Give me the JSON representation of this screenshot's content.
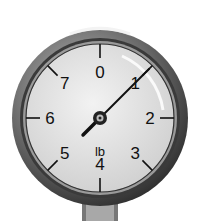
{
  "gauge": {
    "unit": "lb",
    "labels": [
      "0",
      "1",
      "2",
      "3",
      "4",
      "5",
      "6",
      "7"
    ],
    "reading": 1,
    "max": 8,
    "colors": {
      "face": "#e8e8e8",
      "bezel": "#555555",
      "ink": "#111111"
    }
  }
}
